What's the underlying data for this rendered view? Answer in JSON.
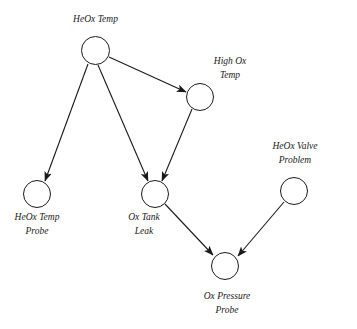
{
  "diagram": {
    "type": "bayesian-network",
    "title_visible": false,
    "background_color": "#ffffff",
    "stroke_color": "#1a1a1a",
    "nodes": [
      {
        "id": "heox-temp",
        "label_lines": [
          "HeOx Temp"
        ],
        "cx": 95.5,
        "cy": 50.5,
        "r": 14.5,
        "label_position": "above"
      },
      {
        "id": "high-ox-temp",
        "label_lines": [
          "High Ox",
          "Temp"
        ],
        "cx": 200,
        "cy": 97,
        "r": 14,
        "label_position": "above-right"
      },
      {
        "id": "heox-temp-probe",
        "label_lines": [
          "HeOx Temp",
          "Probe"
        ],
        "cx": 37,
        "cy": 194,
        "r": 14,
        "label_position": "below"
      },
      {
        "id": "ox-tank-leak",
        "label_lines": [
          "Ox Tank",
          "Leak"
        ],
        "cx": 155,
        "cy": 194,
        "r": 14,
        "label_position": "below-left"
      },
      {
        "id": "heox-valve-problem",
        "label_lines": [
          "HeOx Valve",
          "Problem"
        ],
        "cx": 294,
        "cy": 191,
        "r": 14,
        "label_position": "above"
      },
      {
        "id": "ox-pressure-probe",
        "label_lines": [
          "Ox Pressure",
          "Probe"
        ],
        "cx": 225,
        "cy": 266,
        "r": 14,
        "label_position": "below"
      }
    ],
    "edges": [
      {
        "from": "heox-temp",
        "to": "heox-temp-probe",
        "x1": 88,
        "y1": 64,
        "x2": 45,
        "y2": 181
      },
      {
        "from": "heox-temp",
        "to": "ox-tank-leak",
        "x1": 98,
        "y1": 65,
        "x2": 148,
        "y2": 181
      },
      {
        "from": "heox-temp",
        "to": "high-ox-temp",
        "x1": 109,
        "y1": 57,
        "x2": 186,
        "y2": 92
      },
      {
        "from": "high-ox-temp",
        "to": "ox-tank-leak",
        "x1": 192,
        "y1": 109,
        "x2": 162,
        "y2": 181
      },
      {
        "from": "ox-tank-leak",
        "to": "ox-pressure-probe",
        "x1": 165,
        "y1": 204,
        "x2": 213,
        "y2": 255
      },
      {
        "from": "heox-valve-problem",
        "to": "ox-pressure-probe",
        "x1": 284,
        "y1": 202,
        "x2": 238,
        "y2": 256
      }
    ],
    "labels": {
      "heox_temp": "HeOx Temp",
      "high_ox_line1": "High Ox",
      "high_ox_line2": "Temp",
      "heox_temp_probe_line1": "HeOx Temp",
      "heox_temp_probe_line2": "Probe",
      "ox_tank_leak_line1": "Ox Tank",
      "ox_tank_leak_line2": "Leak",
      "heox_valve_line1": "HeOx Valve",
      "heox_valve_line2": "Problem",
      "ox_pressure_line1": "Ox Pressure",
      "ox_pressure_line2": "Probe"
    }
  }
}
